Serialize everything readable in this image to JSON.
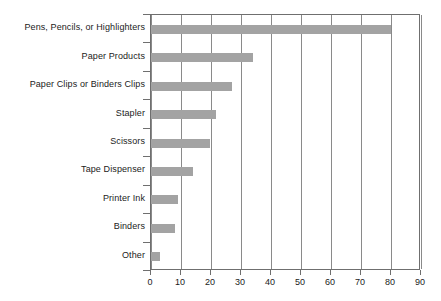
{
  "chart_data": {
    "type": "bar",
    "orientation": "horizontal",
    "title": "",
    "subtitle": "",
    "xlabel": "",
    "ylabel": "",
    "categories": [
      "Pens, Pencils, or Highlighters",
      "Paper Products",
      "Paper Clips or Binders Clips",
      "Stapler",
      "Scissors",
      "Tape Dispenser",
      "Printer Ink",
      "Binders",
      "Other"
    ],
    "values": [
      80,
      34,
      27,
      21.5,
      19.5,
      14,
      9,
      8,
      3
    ],
    "xlim": [
      0,
      90
    ],
    "xticks": [
      0,
      10,
      20,
      30,
      40,
      50,
      60,
      70,
      80,
      90
    ],
    "xtick_labels": [
      "0",
      "10",
      "20",
      "30",
      "40",
      "50",
      "60",
      "70",
      "80",
      "90"
    ],
    "grid": "vertical",
    "legend": null,
    "bar_color": "#a3a3a3",
    "axis_color": "#6f6f6f",
    "grid_color": "#8a8a8a",
    "text_color": "#1b1b1b",
    "background": "#ffffff"
  }
}
